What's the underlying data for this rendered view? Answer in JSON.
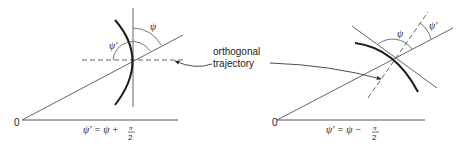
{
  "figure": {
    "left_panel": {
      "origin_label": "0",
      "psi_label": "ψ",
      "psi_prime_label": "ψ′",
      "equation": {
        "lhs": "ψ′ = ψ + ",
        "fraction_num": "π",
        "fraction_den": "2"
      }
    },
    "right_panel": {
      "origin_label": "0",
      "psi_label": "ψ",
      "psi_prime_label": "ψ′",
      "equation": {
        "lhs": "ψ′ = ψ − ",
        "fraction_num": "π",
        "fraction_den": "2"
      }
    },
    "annotation": {
      "line1": "orthogonal",
      "line2": "trajectory"
    },
    "colors": {
      "thin_line": "#555555",
      "curve": "#1a1a1a",
      "text": "#222222"
    }
  }
}
